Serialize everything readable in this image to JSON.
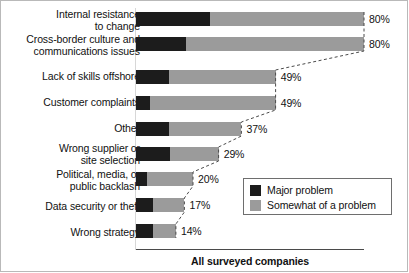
{
  "chart_data": {
    "type": "bar",
    "orientation": "horizontal",
    "stacked": true,
    "title": "",
    "xlabel": "All surveyed companies",
    "ylabel": "",
    "xlim": [
      0,
      100
    ],
    "grid": false,
    "legend_position": "inside-right",
    "categories": [
      "Internal resistance\nto change",
      "Cross-border culture and\ncommunications issues",
      "Lack of skills offshore",
      "Customer complaints",
      "Other",
      "Wrong supplier or\nsite selection",
      "Political, media, or\npublic backlash",
      "Data security or theft",
      "Wrong strategy"
    ],
    "series": [
      {
        "name": "Major problem",
        "color": "#1c1c1c",
        "values": [
          26,
          17.5,
          11.5,
          5,
          11.5,
          12,
          4,
          6,
          6
        ]
      },
      {
        "name": "Somewhat of a problem",
        "color": "#9b9b9b",
        "values": [
          54,
          62.5,
          37.5,
          44,
          25.5,
          17,
          16,
          11,
          8
        ]
      }
    ],
    "totals": [
      80,
      80,
      49,
      49,
      37,
      29,
      20,
      17,
      14
    ],
    "total_labels": [
      "80%",
      "80%",
      "49%",
      "49%",
      "37%",
      "29%",
      "20%",
      "17%",
      "14%"
    ],
    "annotations": [
      "dashed connector line joining the end of each stacked bar"
    ]
  },
  "legend": {
    "items": [
      {
        "label": "Major problem",
        "color": "#1c1c1c"
      },
      {
        "label": "Somewhat of a problem",
        "color": "#9b9b9b"
      }
    ]
  },
  "axis": {
    "caption": "All surveyed companies"
  }
}
